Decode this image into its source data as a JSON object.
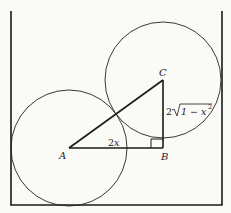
{
  "diagram": {
    "type": "geometry",
    "container": {
      "left": 11,
      "right": 222,
      "top": 11,
      "bottom": 205
    },
    "circles": [
      {
        "name": "circle-A",
        "cx": 69,
        "cy": 148,
        "r": 58
      },
      {
        "name": "circle-C",
        "cx": 163,
        "cy": 80,
        "r": 58
      }
    ],
    "points": {
      "A": {
        "label": "A",
        "x": 69,
        "y": 148
      },
      "B": {
        "label": "B",
        "x": 163,
        "y": 148
      },
      "C": {
        "label": "C",
        "x": 163,
        "y": 80
      }
    },
    "segments": [
      {
        "from": "A",
        "to": "B",
        "label": "2x"
      },
      {
        "from": "B",
        "to": "C",
        "label": "2√(1 − x²)"
      },
      {
        "from": "A",
        "to": "C",
        "label": ""
      }
    ],
    "labels": {
      "A": "A",
      "B": "B",
      "C": "C",
      "ab_length_2": "2",
      "ab_length_x": "x",
      "bc_coef": "2",
      "bc_radicand": "1 − x",
      "bc_exp": "2"
    },
    "right_angle_at": "B",
    "colors": {
      "stroke": "#1a1a1a",
      "background": "#fafaf7"
    }
  }
}
